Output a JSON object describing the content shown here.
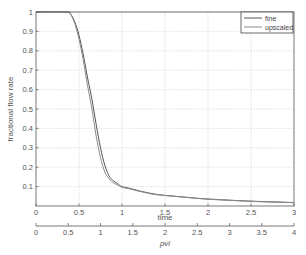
{
  "chart_data": {
    "type": "line",
    "title": "",
    "xlabel": "time",
    "ylabel": "fractional flow rate",
    "secondary_xlabel": "pvi",
    "xlim": [
      0,
      3
    ],
    "ylim": [
      0,
      1
    ],
    "secondary_xlim": [
      0,
      4
    ],
    "grid": true,
    "legend_position": "upper right",
    "xticks": [
      "0",
      "0.5",
      "1",
      "1.5",
      "2",
      "2.5",
      "3"
    ],
    "yticks": [
      "0.1",
      "0.2",
      "0.3",
      "0.4",
      "0.5",
      "0.6",
      "0.7",
      "0.8",
      "0.9",
      "1"
    ],
    "secondary_xticks": [
      "0",
      "0.5",
      "1",
      "1.5",
      "2",
      "2.5",
      "3",
      "3.5",
      "4"
    ],
    "series": [
      {
        "name": "fine",
        "color": "#555555",
        "x": [
          0,
          0.35,
          0.4,
          0.45,
          0.5,
          0.55,
          0.6,
          0.65,
          0.7,
          0.75,
          0.8,
          0.85,
          0.9,
          0.95,
          1.0,
          1.1,
          1.2,
          1.3,
          1.4,
          1.5,
          1.75,
          2.0,
          2.5,
          3.0
        ],
        "values": [
          1.0,
          1.0,
          0.99,
          0.95,
          0.88,
          0.78,
          0.66,
          0.55,
          0.42,
          0.3,
          0.21,
          0.155,
          0.13,
          0.115,
          0.1,
          0.09,
          0.078,
          0.068,
          0.06,
          0.055,
          0.045,
          0.036,
          0.025,
          0.018
        ]
      },
      {
        "name": "upscaled",
        "color": "#8a8a8a",
        "x": [
          0,
          0.35,
          0.4,
          0.45,
          0.5,
          0.55,
          0.6,
          0.65,
          0.7,
          0.75,
          0.8,
          0.85,
          0.9,
          0.95,
          1.0,
          1.1,
          1.2,
          1.3,
          1.4,
          1.5,
          1.75,
          2.0,
          2.5,
          3.0
        ],
        "values": [
          1.0,
          1.0,
          0.99,
          0.94,
          0.86,
          0.75,
          0.62,
          0.5,
          0.36,
          0.25,
          0.175,
          0.14,
          0.12,
          0.108,
          0.097,
          0.087,
          0.076,
          0.066,
          0.058,
          0.054,
          0.044,
          0.035,
          0.024,
          0.017
        ]
      }
    ]
  },
  "legend": {
    "items": [
      {
        "label": "fine"
      },
      {
        "label": "upscaled"
      }
    ]
  }
}
